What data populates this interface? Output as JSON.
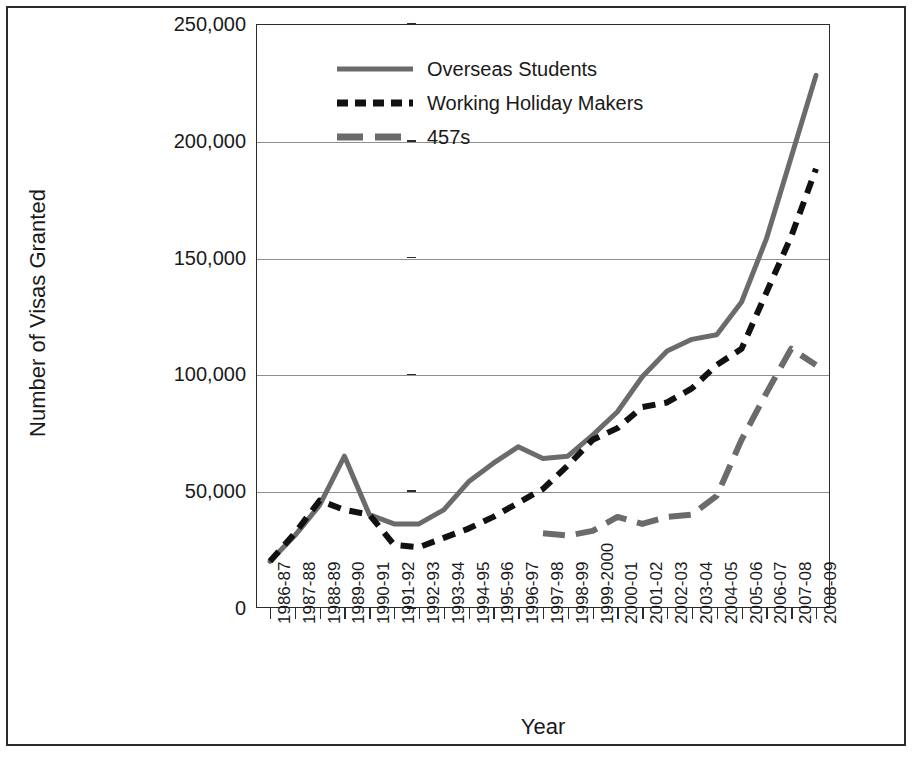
{
  "figure": {
    "frame_color": "#2b2b2b",
    "background": "#ffffff"
  },
  "legend": {
    "position": "top-center-inside",
    "entries": [
      {
        "label": "Overseas Students",
        "style": "solid",
        "color": "#6b6b6b",
        "icon": "legend-line-solid-icon"
      },
      {
        "label": "Working Holiday Makers",
        "style": "dashed",
        "color": "#111111",
        "icon": "legend-line-dashed-icon"
      },
      {
        "label": "457s",
        "style": "long-dash",
        "color": "#6b6b6b",
        "icon": "legend-line-longdash-icon"
      }
    ]
  },
  "axes": {
    "y_title": "Number of Visas Granted",
    "x_title": "Year",
    "y_ticks": [
      "0",
      "50,000",
      "100,000",
      "150,000",
      "200,000",
      "250,000"
    ],
    "y_tick_values": [
      0,
      50000,
      100000,
      150000,
      200000,
      250000
    ],
    "ylim": [
      0,
      250000
    ],
    "grid": "horizontal"
  },
  "chart_data": {
    "type": "line",
    "title": "",
    "subtitle": "",
    "xlabel": "Year",
    "ylabel": "Number of Visas Granted",
    "ylim": [
      0,
      250000
    ],
    "ytick_labels": [
      "0",
      "50,000",
      "100,000",
      "150,000",
      "200,000",
      "250,000"
    ],
    "ytick_values": [
      0,
      50000,
      100000,
      150000,
      200000,
      250000
    ],
    "grid": true,
    "legend_position": "upper center inside plot",
    "categories": [
      "1986-87",
      "1987-88",
      "1988-89",
      "1989-90",
      "1990-91",
      "1991-92",
      "1992-93",
      "1993-94",
      "1994-95",
      "1995-96",
      "1996-97",
      "1997-98",
      "1998-99",
      "1999-2000",
      "2000-01",
      "2001-02",
      "2002-03",
      "2003-04",
      "2004-05",
      "2005-06",
      "2006-07",
      "2007-08",
      "2008-09"
    ],
    "series": [
      {
        "name": "Overseas Students",
        "style": "solid",
        "color": "#6b6b6b",
        "values": [
          20000,
          31000,
          44000,
          65000,
          40000,
          36000,
          36000,
          42000,
          54000,
          62000,
          69000,
          64000,
          65000,
          74000,
          84000,
          99000,
          110000,
          115000,
          117000,
          131000,
          158000,
          193000,
          228000
        ]
      },
      {
        "name": "Working Holiday Makers",
        "style": "dashed",
        "color": "#111111",
        "values": [
          20000,
          32000,
          46000,
          42000,
          40000,
          27000,
          26000,
          30000,
          34000,
          39000,
          45000,
          51000,
          61000,
          72000,
          77000,
          86000,
          88000,
          94000,
          104000,
          111000,
          135000,
          159000,
          188000
        ]
      },
      {
        "name": "457s",
        "style": "long-dash",
        "color": "#6b6b6b",
        "start_index": 11,
        "values": [
          null,
          null,
          null,
          null,
          null,
          null,
          null,
          null,
          null,
          null,
          null,
          32000,
          31000,
          33000,
          39000,
          36000,
          39000,
          40000,
          48000,
          72000,
          92000,
          111000,
          104000
        ]
      }
    ]
  }
}
